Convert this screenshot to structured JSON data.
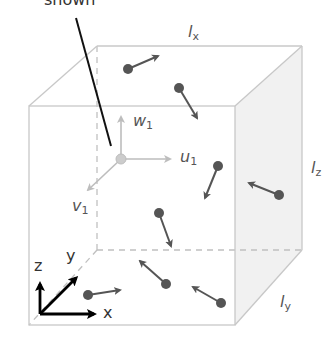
{
  "diagram": {
    "type": "3d-box-with-particles",
    "caption_fragment": "shown",
    "dimension_labels": {
      "lx": {
        "base": "l",
        "sub": "x"
      },
      "ly": {
        "base": "l",
        "sub": "y"
      },
      "lz": {
        "base": "l",
        "sub": "z"
      }
    },
    "velocity_components": {
      "u": {
        "base": "u",
        "sub": "1"
      },
      "v": {
        "base": "v",
        "sub": "1"
      },
      "w": {
        "base": "w",
        "sub": "1"
      }
    },
    "axes": {
      "x": "x",
      "y": "y",
      "z": "z"
    },
    "colors": {
      "edge": "#c8c8c8",
      "side_face": "#f1f1f1",
      "particle": "#555555",
      "component_arrow": "#bdbdbd",
      "pointer_line": "#111111",
      "axis_arrow": "#000000"
    },
    "particle_count": 10
  }
}
